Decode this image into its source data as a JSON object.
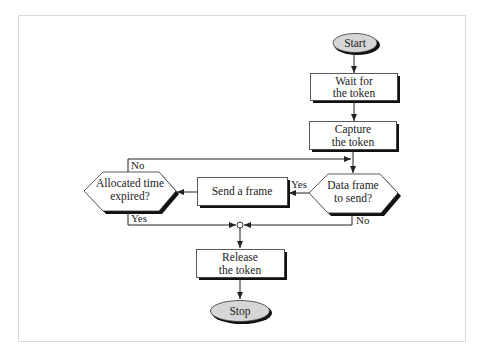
{
  "diagram": {
    "type": "flowchart",
    "colors": {
      "frame": "#d8d8d8",
      "line": "#333333",
      "box_fill": "#ffffff",
      "oval_fill": "#d6d6d6",
      "shadow": "#111111"
    },
    "nodes": {
      "start": {
        "label": "Start",
        "shape": "terminal"
      },
      "wait": {
        "line1": "Wait for",
        "line2": "the token",
        "shape": "process"
      },
      "capture": {
        "line1": "Capture",
        "line2": "the token",
        "shape": "process"
      },
      "data_frame": {
        "line1": "Data frame",
        "line2": "to send?",
        "shape": "decision"
      },
      "send": {
        "label": "Send a frame",
        "shape": "process"
      },
      "allocated": {
        "line1": "Allocated time",
        "line2": "expired?",
        "shape": "decision"
      },
      "release": {
        "line1": "Release",
        "line2": "the token",
        "shape": "process"
      },
      "stop": {
        "label": "Stop",
        "shape": "terminal"
      }
    },
    "edges": {
      "data_yes": "Yes",
      "data_no": "No",
      "alloc_no": "No",
      "alloc_yes": "Yes"
    }
  }
}
